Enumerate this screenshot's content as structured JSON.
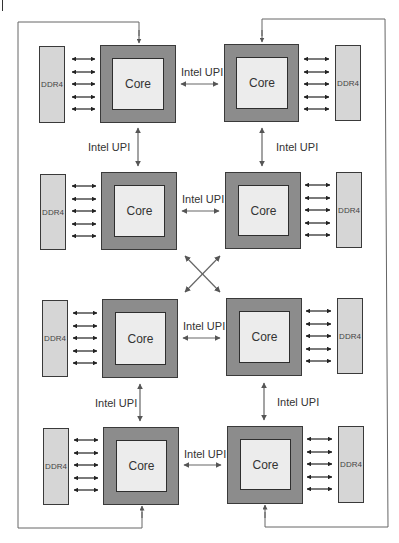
{
  "diagram": {
    "core_label": "Core",
    "memory_label": "DDR4",
    "link_label": "Intel UPI",
    "colors": {
      "package": "#8c8c8c",
      "core": "#ececec",
      "memory": "#d6d6d6",
      "line": "#555555",
      "border": "#3a3a3a"
    },
    "sockets": [
      {
        "id": "s1",
        "row": 1,
        "side": "left",
        "core": "Core",
        "memory": "DDR4",
        "memory_channels": 5
      },
      {
        "id": "s2",
        "row": 1,
        "side": "right",
        "core": "Core",
        "memory": "DDR4",
        "memory_channels": 5
      },
      {
        "id": "s3",
        "row": 2,
        "side": "left",
        "core": "Core",
        "memory": "DDR4",
        "memory_channels": 5
      },
      {
        "id": "s4",
        "row": 2,
        "side": "right",
        "core": "Core",
        "memory": "DDR4",
        "memory_channels": 5
      },
      {
        "id": "s5",
        "row": 3,
        "side": "left",
        "core": "Core",
        "memory": "DDR4",
        "memory_channels": 5
      },
      {
        "id": "s6",
        "row": 3,
        "side": "right",
        "core": "Core",
        "memory": "DDR4",
        "memory_channels": 5
      },
      {
        "id": "s7",
        "row": 4,
        "side": "left",
        "core": "Core",
        "memory": "DDR4",
        "memory_channels": 5
      },
      {
        "id": "s8",
        "row": 4,
        "side": "right",
        "core": "Core",
        "memory": "DDR4",
        "memory_channels": 5
      }
    ],
    "links": {
      "horizontal": [
        {
          "label": "Intel UPI",
          "between": [
            "s1",
            "s2"
          ]
        },
        {
          "label": "Intel UPI",
          "between": [
            "s3",
            "s4"
          ]
        },
        {
          "label": "Intel UPI",
          "between": [
            "s5",
            "s6"
          ]
        },
        {
          "label": "Intel UPI",
          "between": [
            "s7",
            "s8"
          ]
        }
      ],
      "vertical": [
        {
          "label": "Intel UPI",
          "between": [
            "s1",
            "s3"
          ]
        },
        {
          "label": "Intel UPI",
          "between": [
            "s2",
            "s4"
          ]
        },
        {
          "label": "Intel UPI",
          "between": [
            "s5",
            "s7"
          ]
        },
        {
          "label": "Intel UPI",
          "between": [
            "s6",
            "s8"
          ]
        }
      ],
      "cross": [
        [
          "s3",
          "s6"
        ],
        [
          "s4",
          "s5"
        ]
      ],
      "outer_loops": [
        [
          "s1",
          "s7"
        ],
        [
          "s2",
          "s8"
        ]
      ]
    }
  }
}
